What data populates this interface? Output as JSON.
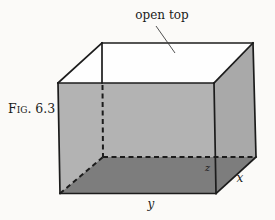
{
  "figure": {
    "caption": "Fig. 6.3",
    "annotation": "open top",
    "axis_labels": {
      "x": "x",
      "y": "y",
      "z": "z"
    }
  },
  "colors": {
    "background": "#fbfaf8",
    "top_face": "#fefefe",
    "front_face": "#b3b3b3",
    "right_face": "#a9a9a9",
    "bottom_face": "#7d7d7d",
    "edge": "#1c1c1c",
    "leader_line": "#3d3d3d"
  }
}
